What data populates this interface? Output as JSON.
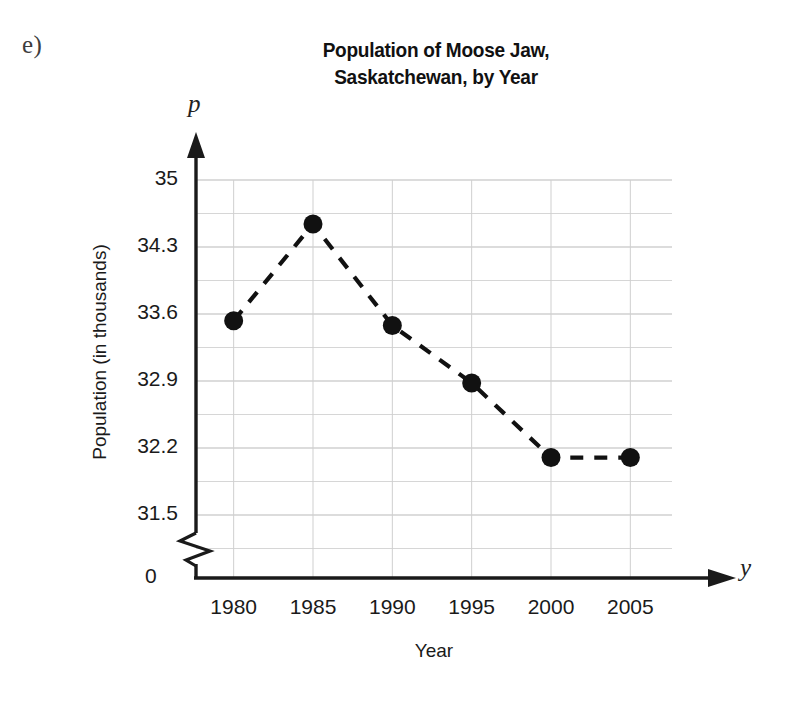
{
  "part_label": "e)",
  "title": {
    "line1": "Population of Moose Jaw,",
    "line2": "Saskatchewan, by Year"
  },
  "axes": {
    "y_variable": "p",
    "x_variable": "y",
    "y_title": "Population (in thousands)",
    "x_title": "Year",
    "origin_label": "0",
    "y_break": true
  },
  "chart_data": {
    "type": "line",
    "title": "Population of Moose Jaw, Saskatchewan, by Year",
    "xlabel": "Year",
    "ylabel": "Population (in thousands)",
    "x": [
      1980,
      1985,
      1990,
      1995,
      2000,
      2005
    ],
    "values": [
      33.53,
      34.54,
      33.48,
      32.88,
      32.1,
      32.1
    ],
    "xtick_labels": [
      "1980",
      "1985",
      "1990",
      "1995",
      "2000",
      "2005"
    ],
    "ytick_labels": [
      "35",
      "34.3",
      "33.6",
      "32.9",
      "32.2",
      "31.5"
    ],
    "ytick_values": [
      35,
      34.3,
      33.6,
      32.9,
      32.2,
      31.5
    ],
    "ylim": [
      31.5,
      35
    ],
    "xlim": [
      1980,
      2005
    ],
    "y_minor_step": 0.35,
    "grid": true,
    "legend": null,
    "line_style": "dashed",
    "marker": "filled-circle",
    "series_color": "#111111",
    "grid_color": "#b9b9b9",
    "axis_color": "#1a1a1a",
    "axis_break_below": 31.5
  }
}
